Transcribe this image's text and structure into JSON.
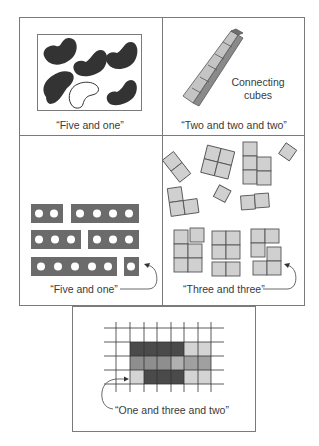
{
  "figure": {
    "panels": [
      {
        "id": "beans",
        "caption": "“Five and one”",
        "description": "Six beans in a box: five dark, one white outline",
        "items": {
          "dark_beans": 5,
          "white_beans": 1
        }
      },
      {
        "id": "connecting-cubes",
        "caption": "“Two and two and two”",
        "side_label_line1": "Connecting",
        "side_label_line2": "cubes",
        "items": {
          "cubes_in_train": 6
        }
      },
      {
        "id": "dot-strips",
        "caption": "“Five and one”",
        "rows": [
          {
            "strips": [
              2,
              4
            ]
          },
          {
            "strips": [
              3,
              3
            ]
          },
          {
            "strips": [
              5,
              1
            ]
          }
        ]
      },
      {
        "id": "square-tiles",
        "caption": "“Three and three”",
        "scattered_groups": [
          3,
          4,
          5,
          1,
          3,
          1,
          2
        ],
        "arranged_groups": [
          {
            "parts": [
              5,
              1
            ]
          },
          {
            "parts": [
              4,
              2
            ]
          },
          {
            "parts": [
              3,
              3
            ]
          }
        ]
      },
      {
        "id": "grid-shading",
        "caption": "“One and three and two”",
        "grid_rows": 3,
        "shading": [
          [
            "dark",
            "dark",
            "dark",
            "dark",
            "light",
            "light"
          ],
          [
            "medium",
            "medium",
            "medium",
            "lightmed",
            "medium-light",
            "medium-light"
          ],
          [
            "light",
            "dark",
            "dark",
            "dark",
            "light",
            "light"
          ]
        ]
      }
    ],
    "colors": {
      "frame": "#7a7a7a",
      "bean_dark": "#3a3a3a",
      "strip": "#6b6b6b",
      "tile": "#d0d0d0",
      "tile_edge": "#555555",
      "cube_top": "#c9c9c9",
      "cube_side": "#8a8a8a",
      "grid_dark": "#4a4a4a",
      "grid_medium": "#8e8e8e",
      "grid_light": "#d4d4d4",
      "grid_lightmed": "#b0b0b0"
    }
  }
}
